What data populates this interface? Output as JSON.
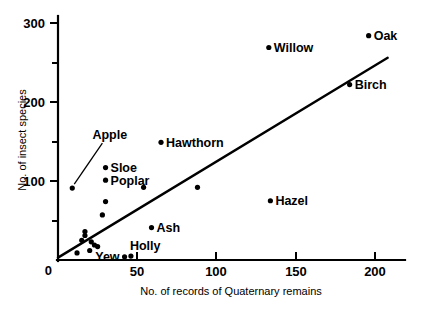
{
  "chart_data": {
    "type": "scatter",
    "title": "",
    "xlabel": "No. of records of Quaternary remains",
    "ylabel": "No. of insect species",
    "xlim": [
      0,
      212
    ],
    "ylim": [
      0,
      310
    ],
    "grid": false,
    "legend": "none",
    "x_ticks_major": [
      0,
      50,
      100,
      150,
      200
    ],
    "x_tick_labels": [
      "0",
      "50",
      "100",
      "150",
      "200"
    ],
    "y_ticks_major": [
      0,
      100,
      200,
      300
    ],
    "y_tick_labels": [
      "0",
      "100",
      "200",
      "300"
    ],
    "y_ticks_minor": [
      50,
      150,
      250
    ],
    "points": [
      {
        "label": "Oak",
        "x": 196,
        "y": 284,
        "label_pos": "right"
      },
      {
        "label": "Willow",
        "x": 133,
        "y": 269,
        "label_pos": "right"
      },
      {
        "label": "Birch",
        "x": 184,
        "y": 222,
        "label_pos": "right"
      },
      {
        "label": "Hawthorn",
        "x": 65,
        "y": 149,
        "label_pos": "right"
      },
      {
        "label": "Sloe",
        "x": 30,
        "y": 117,
        "label_pos": "right"
      },
      {
        "label": "Poplar",
        "x": 30,
        "y": 101,
        "label_pos": "right"
      },
      {
        "label": "Apple",
        "x": 9,
        "y": 91,
        "label_pos": "leader"
      },
      {
        "label": "Hazel",
        "x": 134,
        "y": 75,
        "label_pos": "right"
      },
      {
        "label": "Ash",
        "x": 59,
        "y": 41,
        "label_pos": "right"
      },
      {
        "label": "Holly",
        "x": 46,
        "y": 5,
        "label_pos": "above"
      },
      {
        "label": "Yew",
        "x": 42,
        "y": 4,
        "label_pos": "left"
      },
      {
        "label": "",
        "x": 54,
        "y": 92,
        "label_pos": "none"
      },
      {
        "label": "",
        "x": 88,
        "y": 92,
        "label_pos": "none"
      },
      {
        "label": "",
        "x": 30,
        "y": 74,
        "label_pos": "none"
      },
      {
        "label": "",
        "x": 28,
        "y": 57,
        "label_pos": "none"
      },
      {
        "label": "",
        "x": 17,
        "y": 36,
        "label_pos": "none"
      },
      {
        "label": "",
        "x": 17,
        "y": 31,
        "label_pos": "none"
      },
      {
        "label": "",
        "x": 15,
        "y": 25,
        "label_pos": "none"
      },
      {
        "label": "",
        "x": 21,
        "y": 23,
        "label_pos": "none"
      },
      {
        "label": "",
        "x": 23,
        "y": 19,
        "label_pos": "none"
      },
      {
        "label": "",
        "x": 25,
        "y": 17,
        "label_pos": "none"
      },
      {
        "label": "",
        "x": 20,
        "y": 12,
        "label_pos": "none"
      },
      {
        "label": "",
        "x": 12,
        "y": 9,
        "label_pos": "none"
      }
    ],
    "trendline": {
      "x1": 0,
      "y1": 3,
      "x2": 208,
      "y2": 256
    },
    "apple_leader": {
      "text_x": 28,
      "text_y": 148,
      "dot_x": 9,
      "dot_y": 91
    }
  }
}
